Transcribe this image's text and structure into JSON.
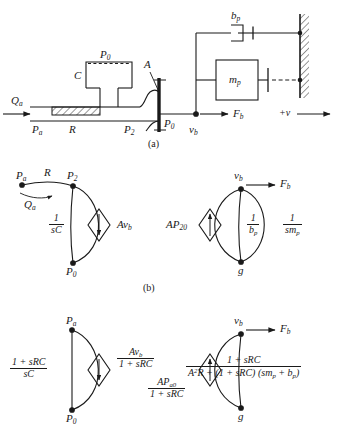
{
  "figure": {
    "captions": [
      {
        "id": "caption-a",
        "text": "(a)"
      },
      {
        "id": "caption-b",
        "text": "(b)"
      }
    ]
  },
  "schematic": {
    "name": "pneumatic-valve-schematic",
    "labels": {
      "supply_flow": "Qa",
      "supply_flow_sub": "a",
      "supply_pressure": "Pa",
      "resistance": "R",
      "chamber": "C",
      "chamber_pressure": "P0",
      "area": "A",
      "downstream_pressure": "P2",
      "outlet_pressure": "P0",
      "velocity": "vb",
      "force": "Fb",
      "damper": "bp",
      "mass": "mp",
      "positive_direction": "+v"
    }
  },
  "graph_b": {
    "name": "linear-graph-b",
    "nodes": [
      {
        "id": "node-pa",
        "label": "Pa",
        "base": "P",
        "sub": "a"
      },
      {
        "id": "node-p2",
        "label": "P2",
        "base": "P",
        "sub": "2"
      },
      {
        "id": "node-p0",
        "label": "P0",
        "base": "P",
        "sub": "0"
      },
      {
        "id": "node-vb",
        "label": "vb",
        "base": "v",
        "sub": "b"
      },
      {
        "id": "node-g",
        "label": "g",
        "base": "g",
        "sub": ""
      }
    ],
    "branches": [
      {
        "id": "branch-R",
        "label": "R",
        "type": "resistance"
      },
      {
        "id": "branch-Qa",
        "label": "Qa",
        "base": "Q",
        "sub": "a",
        "type": "flow-arrow"
      },
      {
        "id": "branch-capacitance",
        "num": "1",
        "den": "sC",
        "type": "fraction"
      },
      {
        "id": "branch-source-avb",
        "base": "Av",
        "sub": "b",
        "type": "source"
      },
      {
        "id": "branch-source-ap20",
        "base": "AP",
        "sub": "20",
        "type": "source"
      },
      {
        "id": "branch-damping",
        "num": "1",
        "den": "bp",
        "den_base": "b",
        "den_sub": "p",
        "type": "fraction"
      },
      {
        "id": "branch-inertia",
        "num": "1",
        "den": "smp",
        "den_base": "sm",
        "den_sub": "p",
        "type": "fraction"
      },
      {
        "id": "branch-force",
        "base": "F",
        "sub": "b",
        "label": "Fb",
        "type": "force-arrow"
      }
    ]
  },
  "graph_c": {
    "name": "reduced-linear-graph-c",
    "nodes": [
      {
        "id": "node-pa",
        "label": "Pa",
        "base": "P",
        "sub": "a"
      },
      {
        "id": "node-p0",
        "label": "P0",
        "base": "P",
        "sub": "0"
      },
      {
        "id": "node-vb",
        "label": "vb",
        "base": "v",
        "sub": "b"
      },
      {
        "id": "node-g",
        "label": "g",
        "base": "g",
        "sub": ""
      }
    ],
    "branches": [
      {
        "id": "branch-impedance-left",
        "num": "1 + sRC",
        "den": "sC",
        "type": "fraction"
      },
      {
        "id": "branch-source-avb",
        "num_base": "Av",
        "num_sub": "b",
        "den": "1 + sRC",
        "type": "source-fraction"
      },
      {
        "id": "branch-source-apa0",
        "num_base": "AP",
        "num_sub": "a0",
        "den": "1 + sRC",
        "type": "source-fraction"
      },
      {
        "id": "branch-mechanical",
        "num": "1 + sRC",
        "den_pre": "A",
        "den_sup": "2",
        "den_post": "R + (1 + sRC) (sm",
        "den_sub1": "p",
        "den_mid": " + b",
        "den_sub2": "p",
        "den_end": ")",
        "type": "fraction"
      },
      {
        "id": "branch-force",
        "label": "Fb",
        "base": "F",
        "sub": "b",
        "type": "force-arrow"
      }
    ]
  }
}
